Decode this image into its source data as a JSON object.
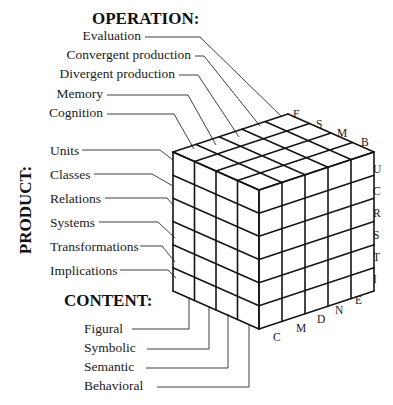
{
  "operation": {
    "heading": "OPERATION:",
    "items": [
      "Evaluation",
      "Convergent production",
      "Divergent production",
      "Memory",
      "Cognition"
    ],
    "axis_letters": [
      "F",
      "S",
      "M",
      "B"
    ]
  },
  "product": {
    "heading": "PRODUCT:",
    "items": [
      "Units",
      "Classes",
      "Relations",
      "Systems",
      "Transformations",
      "Implications"
    ],
    "axis_letters": [
      "U",
      "C",
      "R",
      "S",
      "T",
      "I"
    ]
  },
  "content": {
    "heading": "CONTENT:",
    "items": [
      "Figural",
      "Symbolic",
      "Semantic",
      "Behavioral"
    ],
    "axis_letters": [
      "C",
      "M",
      "D",
      "N",
      "E"
    ]
  },
  "colors": {
    "line": "#151515",
    "text": "#1a1a1a",
    "background": "#ffffff"
  }
}
